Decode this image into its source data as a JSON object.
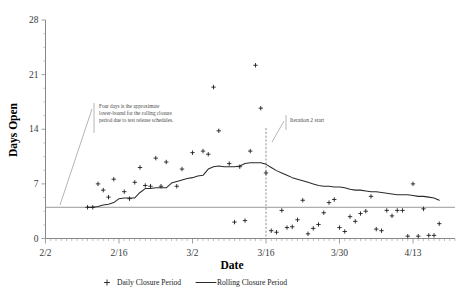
{
  "chart_data": {
    "type": "scatter",
    "title": "",
    "xlabel": "Date",
    "ylabel": "Days Open",
    "ylim": [
      0,
      28
    ],
    "yticks": [
      0,
      7,
      14,
      21,
      28
    ],
    "ytick_labels": [
      "0",
      "7",
      "14",
      "21",
      "28"
    ],
    "xlim_dates": [
      "2/2",
      "4/20"
    ],
    "xticks": [
      0,
      14,
      28,
      42,
      56,
      70
    ],
    "xtick_labels": [
      "2/2",
      "2/16",
      "3/2",
      "3/16",
      "3/30",
      "4/13"
    ],
    "grid": false,
    "legend_position": "bottom",
    "legend": [
      {
        "label": "Daily Closure Period",
        "marker": "plus",
        "style": "scatter"
      },
      {
        "label": "Rolling Closure Period",
        "marker": "line",
        "style": "line"
      }
    ],
    "annotations": [
      {
        "name": "lower-bound-note",
        "lines": [
          "Four days is the approximate",
          "lower-bound for the rolling closure",
          "period due to test release schedules."
        ],
        "reference_value": 4,
        "reference_label": "4 days lower bound"
      },
      {
        "name": "iteration-2-start",
        "lines": [
          "Iteration 2 start"
        ],
        "at_x_day": 42,
        "at_x_date": "3/16"
      }
    ],
    "series": [
      {
        "name": "Daily Closure Period",
        "type": "scatter",
        "points": [
          [
            8,
            4.0
          ],
          [
            9,
            4.0
          ],
          [
            10,
            7.0
          ],
          [
            11,
            6.2
          ],
          [
            12,
            5.3
          ],
          [
            13,
            7.6
          ],
          [
            15,
            6.0
          ],
          [
            16,
            5.1
          ],
          [
            17,
            7.2
          ],
          [
            18,
            9.1
          ],
          [
            19,
            6.8
          ],
          [
            20,
            6.7
          ],
          [
            21,
            10.3
          ],
          [
            22,
            6.7
          ],
          [
            23,
            9.8
          ],
          [
            25,
            6.7
          ],
          [
            26,
            8.9
          ],
          [
            28,
            11.0
          ],
          [
            30,
            11.2
          ],
          [
            31,
            10.8
          ],
          [
            32,
            19.4
          ],
          [
            33,
            13.8
          ],
          [
            35,
            9.6
          ],
          [
            36,
            2.1
          ],
          [
            37,
            9.2
          ],
          [
            38,
            2.3
          ],
          [
            39,
            11.2
          ],
          [
            40,
            22.2
          ],
          [
            41,
            16.7
          ],
          [
            42,
            8.4
          ],
          [
            43,
            1.0
          ],
          [
            44,
            0.8
          ],
          [
            45,
            3.6
          ],
          [
            46,
            1.4
          ],
          [
            47,
            1.5
          ],
          [
            48,
            2.4
          ],
          [
            49,
            4.9
          ],
          [
            50,
            0.6
          ],
          [
            51,
            1.3
          ],
          [
            52,
            1.8
          ],
          [
            53,
            3.3
          ],
          [
            54,
            4.6
          ],
          [
            55,
            5.0
          ],
          [
            56,
            1.4
          ],
          [
            57,
            0.9
          ],
          [
            58,
            2.8
          ],
          [
            59,
            2.2
          ],
          [
            60,
            3.2
          ],
          [
            61,
            3.5
          ],
          [
            62,
            5.4
          ],
          [
            63,
            1.2
          ],
          [
            64,
            1.0
          ],
          [
            65,
            3.6
          ],
          [
            66,
            2.9
          ],
          [
            67,
            3.6
          ],
          [
            68,
            3.6
          ],
          [
            69,
            0.3
          ],
          [
            70,
            7.0
          ],
          [
            71,
            0.3
          ],
          [
            72,
            3.8
          ],
          [
            73,
            0.4
          ],
          [
            74,
            0.4
          ],
          [
            75,
            1.9
          ]
        ]
      },
      {
        "name": "Rolling Closure Period",
        "type": "line",
        "points": [
          [
            8,
            4.0
          ],
          [
            9,
            4.0
          ],
          [
            10,
            4.1
          ],
          [
            11,
            4.3
          ],
          [
            12,
            4.4
          ],
          [
            13,
            4.6
          ],
          [
            14,
            5.1
          ],
          [
            15,
            5.2
          ],
          [
            16,
            5.2
          ],
          [
            17,
            5.2
          ],
          [
            18,
            5.9
          ],
          [
            19,
            6.4
          ],
          [
            20,
            6.4
          ],
          [
            21,
            6.5
          ],
          [
            22,
            6.5
          ],
          [
            23,
            6.5
          ],
          [
            24,
            7.1
          ],
          [
            25,
            7.3
          ],
          [
            26,
            7.5
          ],
          [
            27,
            7.7
          ],
          [
            28,
            7.8
          ],
          [
            29,
            8.0
          ],
          [
            30,
            8.1
          ],
          [
            31,
            8.9
          ],
          [
            32,
            9.2
          ],
          [
            33,
            9.3
          ],
          [
            34,
            9.2
          ],
          [
            35,
            9.2
          ],
          [
            36,
            9.2
          ],
          [
            37,
            9.3
          ],
          [
            38,
            9.6
          ],
          [
            39,
            9.7
          ],
          [
            40,
            9.7
          ],
          [
            41,
            9.7
          ],
          [
            42,
            9.5
          ],
          [
            43,
            9.1
          ],
          [
            44,
            8.7
          ],
          [
            45,
            8.4
          ],
          [
            46,
            8.1
          ],
          [
            47,
            7.8
          ],
          [
            48,
            7.6
          ],
          [
            49,
            7.4
          ],
          [
            50,
            7.2
          ],
          [
            51,
            7.0
          ],
          [
            52,
            6.8
          ],
          [
            53,
            6.7
          ],
          [
            54,
            6.7
          ],
          [
            55,
            6.6
          ],
          [
            56,
            6.6
          ],
          [
            57,
            6.5
          ],
          [
            58,
            6.3
          ],
          [
            59,
            6.2
          ],
          [
            60,
            6.2
          ],
          [
            61,
            6.1
          ],
          [
            62,
            6.0
          ],
          [
            63,
            6.0
          ],
          [
            64,
            5.9
          ],
          [
            65,
            5.8
          ],
          [
            66,
            5.7
          ],
          [
            67,
            5.6
          ],
          [
            68,
            5.6
          ],
          [
            69,
            5.6
          ],
          [
            70,
            5.5
          ],
          [
            71,
            5.4
          ],
          [
            72,
            5.4
          ],
          [
            73,
            5.3
          ],
          [
            74,
            5.2
          ],
          [
            75,
            4.9
          ]
        ]
      }
    ]
  },
  "colors": {
    "series_line": "#2b2b2b",
    "marker": "#151515",
    "reference_line": "#9a9a9a",
    "axis": "#7a7a7a",
    "annotation": "#4a4a4a",
    "background": "#ffffff"
  }
}
